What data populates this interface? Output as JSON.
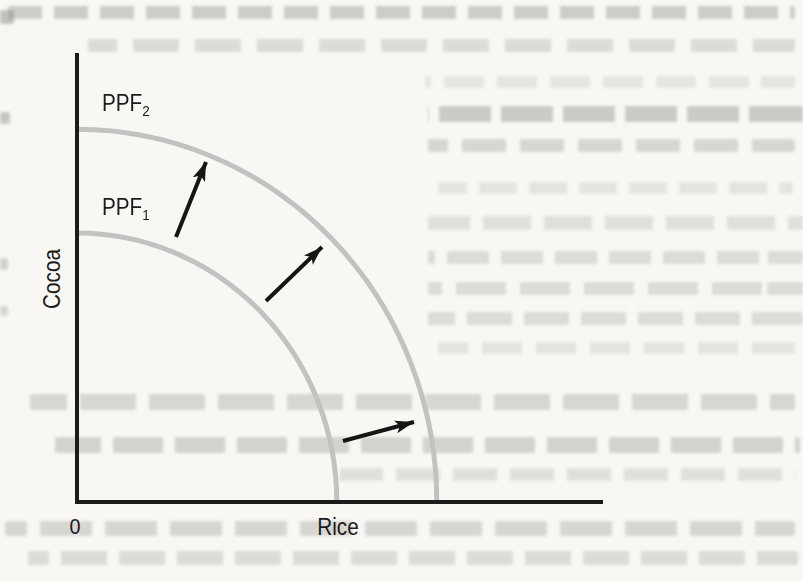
{
  "figure": {
    "y_axis_label": "Cocoa",
    "x_axis_label": "Rice",
    "origin_label": "0",
    "curve_labels": {
      "ppf2": {
        "base": "PPF",
        "sub": "2"
      },
      "ppf1": {
        "base": "PPF",
        "sub": "1"
      }
    },
    "colors": {
      "curve": "#c2c2c0",
      "axis": "#1b1b1b",
      "arrow": "#151515",
      "text": "#1b1b1b",
      "page_bg": "#f8f7f4"
    }
  },
  "chart_data": {
    "type": "line",
    "title": "",
    "xlabel": "Rice",
    "ylabel": "Cocoa",
    "x_tick_labels": [
      "0"
    ],
    "y_tick_labels": [],
    "grid": false,
    "legend_position": "none",
    "axes_numeric": false,
    "series": [
      {
        "name": "PPF1",
        "label": "PPF₁",
        "shape": "quarter-ellipse",
        "x_intercept_frac": 0.494,
        "y_intercept_frac": 0.599
      },
      {
        "name": "PPF2",
        "label": "PPF₂",
        "shape": "quarter-ellipse",
        "x_intercept_frac": 0.684,
        "y_intercept_frac": 0.83
      }
    ],
    "annotations": [
      {
        "type": "arrow",
        "from_px": [
          176,
          237
        ],
        "to_px": [
          206,
          162
        ]
      },
      {
        "type": "arrow",
        "from_px": [
          266,
          301
        ],
        "to_px": [
          322,
          247
        ]
      },
      {
        "type": "arrow",
        "from_px": [
          343,
          441
        ],
        "to_px": [
          414,
          422
        ]
      }
    ]
  }
}
